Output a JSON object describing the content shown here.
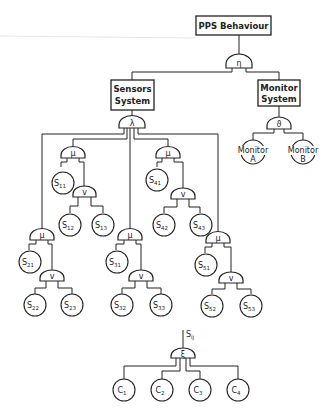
{
  "diagram": {
    "title_box": "PPS Behaviour",
    "root_gate": "η",
    "subsystems": [
      {
        "label_line1": "Sensors",
        "label_line2": "System",
        "gate": "λ"
      },
      {
        "label_line1": "Monitor",
        "label_line2": "System",
        "gate": "ϑ"
      }
    ],
    "monitors": [
      {
        "line1": "Monitor",
        "line2": "A"
      },
      {
        "line1": "Monitor",
        "line2": "B"
      }
    ],
    "sensor_groups": [
      {
        "top_gate": "μ",
        "sub_gate": "v",
        "s1": "11",
        "s2": "12",
        "s3": "13"
      },
      {
        "top_gate": "μ",
        "sub_gate": "v",
        "s1": "21",
        "s2": "22",
        "s3": "23"
      },
      {
        "top_gate": "μ",
        "sub_gate": "v",
        "s1": "31",
        "s2": "32",
        "s3": "33"
      },
      {
        "top_gate": "μ",
        "sub_gate": "v",
        "s1": "41",
        "s2": "42",
        "s3": "43"
      },
      {
        "top_gate": "μ",
        "sub_gate": "v",
        "s1": "51",
        "s2": "52",
        "s3": "53"
      }
    ],
    "node_letter": "S",
    "component_tree": {
      "input_label": "S",
      "input_sub": "ij",
      "gate": "ξ",
      "components": [
        {
          "letter": "C",
          "sub": "1"
        },
        {
          "letter": "C",
          "sub": "2"
        },
        {
          "letter": "C",
          "sub": "3"
        },
        {
          "letter": "C",
          "sub": "4"
        }
      ]
    }
  }
}
